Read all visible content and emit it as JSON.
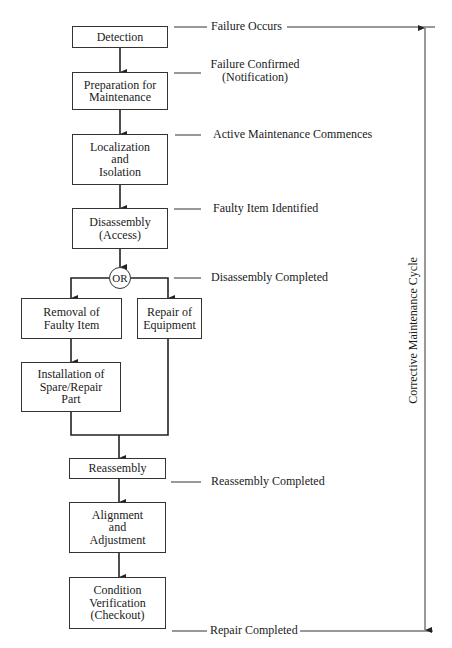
{
  "diagram": {
    "title": "Corrective Maintenance Cycle",
    "steps": [
      {
        "id": "detection",
        "label": "Detection"
      },
      {
        "id": "preparation",
        "label": "Preparation for\nMaintenance"
      },
      {
        "id": "localization",
        "label": "Localization\nand\nIsolation"
      },
      {
        "id": "disassembly",
        "label": "Disassembly\n(Access)"
      },
      {
        "id": "removal",
        "label": "Removal of\nFaulty Item"
      },
      {
        "id": "repair",
        "label": "Repair of\nEquipment"
      },
      {
        "id": "installation",
        "label": "Installation of\nSpare/Repair\nPart"
      },
      {
        "id": "reassembly",
        "label": "Reassembly"
      },
      {
        "id": "alignment",
        "label": "Alignment\nand\nAdjustment"
      },
      {
        "id": "verification",
        "label": "Condition\nVerification\n(Checkout)"
      }
    ],
    "decision": {
      "label": "OR"
    },
    "milestones": [
      {
        "label": "Failure Occurs"
      },
      {
        "label": "Failure Confirmed\n(Notification)"
      },
      {
        "label": "Active Maintenance Commences"
      },
      {
        "label": "Faulty Item Identified"
      },
      {
        "label": "Disassembly Completed"
      },
      {
        "label": "Reassembly Completed"
      },
      {
        "label": "Repair Completed"
      }
    ],
    "cycle_label": "Corrective Maintenance Cycle",
    "colors": {
      "line": "#333333",
      "text": "#1a1a1a",
      "background": "#ffffff"
    }
  }
}
